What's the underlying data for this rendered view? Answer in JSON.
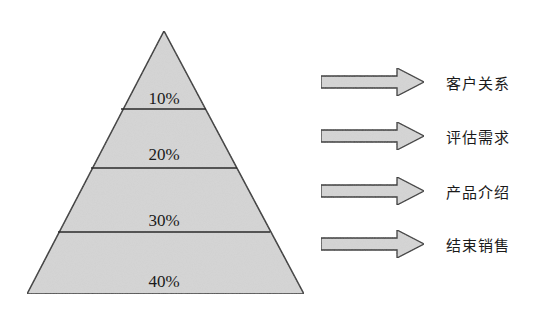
{
  "diagram": {
    "type": "sales-pyramid",
    "colors": {
      "fill": "#d6d6d6",
      "stroke": "#2a2a2a",
      "text": "#1a1a1a",
      "background": "#ffffff"
    },
    "layers": [
      {
        "percent": "10%"
      },
      {
        "percent": "20%"
      },
      {
        "percent": "30%"
      },
      {
        "percent": "40%"
      }
    ],
    "stages": [
      {
        "label": "客户关系"
      },
      {
        "label": "评估需求"
      },
      {
        "label": "产品介绍"
      },
      {
        "label": "结束销售"
      }
    ]
  }
}
